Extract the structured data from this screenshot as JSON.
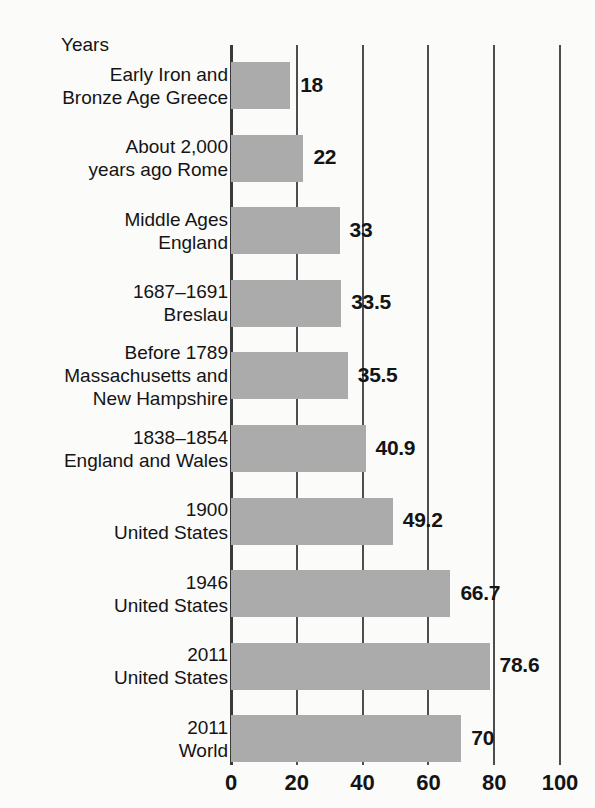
{
  "header": {
    "axis_title": "Years"
  },
  "chart_data": {
    "type": "bar",
    "orientation": "horizontal",
    "title": "Years",
    "xlabel": "Years",
    "ylabel": "",
    "xlim": [
      0,
      100
    ],
    "grid": true,
    "legend": false,
    "bar_color": "#ababab",
    "categories": [
      "Early Iron and\nBronze Age Greece",
      "About 2,000\nyears ago Rome",
      "Middle Ages\nEngland",
      "1687–1691\nBreslau",
      "Before 1789\nMassachusetts and\nNew Hampshire",
      "1838–1854\nEngland and Wales",
      "1900\nUnited States",
      "1946\nUnited States",
      "2011\nUnited States",
      "2011\nWorld"
    ],
    "values": [
      18,
      22,
      33,
      33.5,
      35.5,
      40.9,
      49.2,
      66.7,
      78.6,
      70
    ],
    "value_labels": [
      "18",
      "22",
      "33",
      "33.5",
      "35.5",
      "40.9",
      "49.2",
      "66.7",
      "78.6",
      "70"
    ],
    "ticks": [
      0,
      20,
      40,
      60,
      80,
      100
    ],
    "tick_labels": [
      "0",
      "20",
      "40",
      "60",
      "80",
      "100"
    ]
  },
  "rows": [
    {
      "label_line1": "Early Iron and",
      "label_line2": "Bronze Age Greece",
      "label_line3": "",
      "value": 18,
      "value_label": "18"
    },
    {
      "label_line1": "About 2,000",
      "label_line2": "years ago Rome",
      "label_line3": "",
      "value": 22,
      "value_label": "22"
    },
    {
      "label_line1": "Middle Ages",
      "label_line2": "England",
      "label_line3": "",
      "value": 33,
      "value_label": "33"
    },
    {
      "label_line1": "1687–1691",
      "label_line2": "Breslau",
      "label_line3": "",
      "value": 33.5,
      "value_label": "33.5"
    },
    {
      "label_line1": "Before 1789",
      "label_line2": "Massachusetts and",
      "label_line3": "New Hampshire",
      "value": 35.5,
      "value_label": "35.5"
    },
    {
      "label_line1": "1838–1854",
      "label_line2": "England and Wales",
      "label_line3": "",
      "value": 40.9,
      "value_label": "40.9"
    },
    {
      "label_line1": "1900",
      "label_line2": "United States",
      "label_line3": "",
      "value": 49.2,
      "value_label": "49.2"
    },
    {
      "label_line1": "1946",
      "label_line2": "United States",
      "label_line3": "",
      "value": 66.7,
      "value_label": "66.7"
    },
    {
      "label_line1": "2011",
      "label_line2": "United States",
      "label_line3": "",
      "value": 78.6,
      "value_label": "78.6"
    },
    {
      "label_line1": "2011",
      "label_line2": "World",
      "label_line3": "",
      "value": 70,
      "value_label": "70"
    }
  ],
  "axis": {
    "ticks": [
      {
        "label": "0",
        "value": 0
      },
      {
        "label": "20",
        "value": 20
      },
      {
        "label": "40",
        "value": 40
      },
      {
        "label": "60",
        "value": 60
      },
      {
        "label": "80",
        "value": 80
      },
      {
        "label": "100",
        "value": 100
      }
    ]
  },
  "geometry": {
    "x0": 231,
    "px_per_unit": 3.29,
    "first_bar_top": 62,
    "bar_height": 47,
    "row_pitch": 72.6,
    "label_right": 228,
    "tick_label_y": 770,
    "grid_top": 45,
    "grid_bottom": 765
  }
}
